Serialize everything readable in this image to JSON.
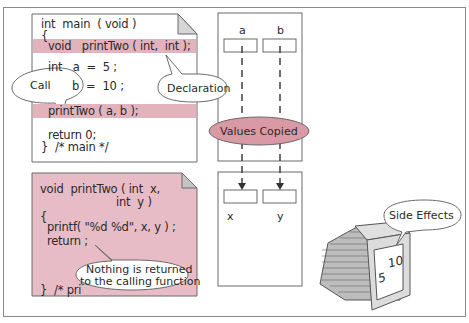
{
  "main_function": {
    "lines": [
      "int  main  ( void )",
      "{",
      "  void   printTwo ( int,  int );",
      "  int   a  =  5 ;",
      "         b  =  10 ;",
      "  printTwo ( a, b );",
      "  return 0;",
      "}  /* main */"
    ]
  },
  "printtwo_function": {
    "lines": [
      "void  printTwo ( int  x,",
      "                      int  y )",
      "{",
      "  printf( \"%d %d\", x, y ) ;",
      "  return ;",
      "}  /* pri"
    ]
  },
  "callouts": {
    "call": "Call",
    "declaration": "Declaration",
    "values_copied": "Values Copied",
    "nothing_returned_1": "Nothing is returned",
    "nothing_returned_2": "to the calling function",
    "side_effects": "Side Effects"
  },
  "memory": {
    "caller_vars": [
      "a",
      "b"
    ],
    "callee_vars": [
      "x",
      "y"
    ]
  },
  "monitor": {
    "output_1": "5",
    "output_2": "10"
  },
  "colors": {
    "highlight": "#e2b3bd",
    "callee_bg": "#e7bcc6",
    "ellipse_fill": "#d99aa6"
  }
}
